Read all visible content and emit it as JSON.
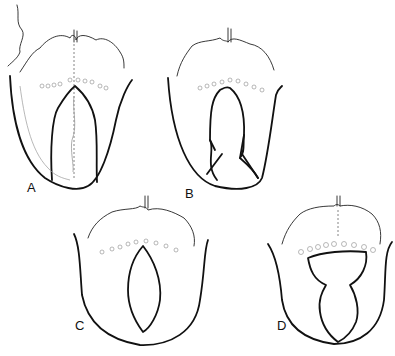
{
  "figure": {
    "panels": [
      {
        "id": "A",
        "label": "A",
        "description": "Tongue with long narrow wedge excision extending to tip"
      },
      {
        "id": "B",
        "label": "B",
        "description": "Tongue with elongated excision flaring to wedge at tip"
      },
      {
        "id": "C",
        "label": "C",
        "description": "Tongue with central elliptical (lens-shaped) excision"
      },
      {
        "id": "D",
        "label": "D",
        "description": "Tongue with posterior wide excision narrowing into anterior keyhole shape"
      }
    ]
  }
}
